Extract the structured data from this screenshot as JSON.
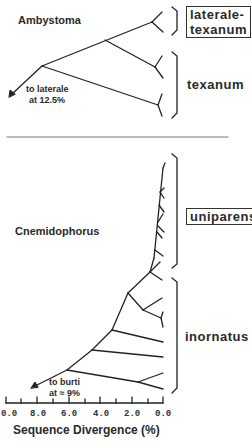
{
  "figure": {
    "top_panel": {
      "genus_label": "Ambystoma",
      "outgroup_note_line1": "to  laterale",
      "outgroup_note_line2": "at  12.5%",
      "group_labels": [
        {
          "text": "laterale-",
          "text2": "texanum",
          "boxed": true
        },
        {
          "text": "texanum",
          "boxed": false
        }
      ]
    },
    "bottom_panel": {
      "genus_label": "Cnemidophorus",
      "outgroup_note_line1": "to  burti",
      "outgroup_note_line2": "at ≈ 9%",
      "group_labels": [
        {
          "text": "uniparens",
          "boxed": true
        },
        {
          "text": "inornatus",
          "boxed": false
        }
      ]
    },
    "axis": {
      "title": "Sequence Divergence (%)",
      "ticks": [
        "0.0",
        "8.0",
        "6.0",
        "4.0",
        "2.0",
        "0.0"
      ]
    },
    "colors": {
      "line": "#222222",
      "divider": "#777777",
      "background": "#ffffff"
    }
  }
}
